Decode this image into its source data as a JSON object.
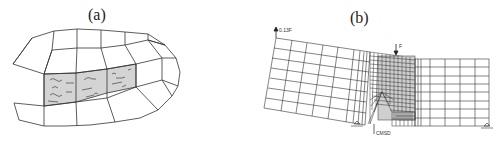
{
  "panels": [
    {
      "id": "a",
      "caption": "(a)",
      "description": "Curved quadrilateral mesh with shaded cracked band of elements"
    },
    {
      "id": "b",
      "caption": "(b)",
      "labels": {
        "left_load": "0.13F",
        "top_load": "F",
        "bottom_gauge": "CMSD"
      },
      "description": "Finite element mesh of notched beam with refined central zone"
    }
  ],
  "colors": {
    "line": "#333333",
    "shade": "#d4d4d4",
    "background": "#ffffff"
  }
}
